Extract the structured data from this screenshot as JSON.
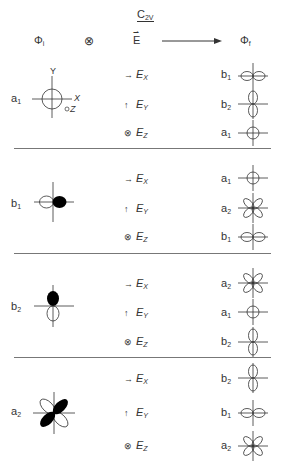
{
  "header": {
    "group": "C",
    "group_sub": "2V",
    "initial_state": "Φ",
    "initial_sub": "i",
    "product_symbol": "⊗",
    "field": "E",
    "final_state": "Φ",
    "final_sub": "f"
  },
  "axis_labels": {
    "x": "X",
    "y": "Y",
    "z": "Z"
  },
  "blocks": [
    {
      "initial": {
        "label": "a",
        "sub": "1",
        "orbital": "s-circle"
      },
      "rows": [
        {
          "field_icon": "→",
          "field": "E",
          "field_sub": "X",
          "final_label": "b",
          "final_sub": "1",
          "final_orbital": "px"
        },
        {
          "field_icon": "↑",
          "field": "E",
          "field_sub": "Y",
          "final_label": "b",
          "final_sub": "2",
          "final_orbital": "py"
        },
        {
          "field_icon": "⊗",
          "field": "E",
          "field_sub": "Z",
          "final_label": "a",
          "final_sub": "1",
          "final_orbital": "s"
        }
      ]
    },
    {
      "initial": {
        "label": "b",
        "sub": "1",
        "orbital": "px-shaded"
      },
      "rows": [
        {
          "field_icon": "→",
          "field": "E",
          "field_sub": "X",
          "final_label": "a",
          "final_sub": "1",
          "final_orbital": "s"
        },
        {
          "field_icon": "↑",
          "field": "E",
          "field_sub": "Y",
          "final_label": "a",
          "final_sub": "2",
          "final_orbital": "dxy"
        },
        {
          "field_icon": "⊗",
          "field": "E",
          "field_sub": "Z",
          "final_label": "b",
          "final_sub": "1",
          "final_orbital": "px"
        }
      ]
    },
    {
      "initial": {
        "label": "b",
        "sub": "2",
        "orbital": "py-shaded"
      },
      "rows": [
        {
          "field_icon": "→",
          "field": "E",
          "field_sub": "X",
          "final_label": "a",
          "final_sub": "2",
          "final_orbital": "dxy"
        },
        {
          "field_icon": "↑",
          "field": "E",
          "field_sub": "Y",
          "final_label": "a",
          "final_sub": "1",
          "final_orbital": "s"
        },
        {
          "field_icon": "⊗",
          "field": "E",
          "field_sub": "Z",
          "final_label": "b",
          "final_sub": "2",
          "final_orbital": "py"
        }
      ]
    },
    {
      "initial": {
        "label": "a",
        "sub": "2",
        "orbital": "dxy-shaded"
      },
      "rows": [
        {
          "field_icon": "→",
          "field": "E",
          "field_sub": "X",
          "final_label": "b",
          "final_sub": "2",
          "final_orbital": "py"
        },
        {
          "field_icon": "↑",
          "field": "E",
          "field_sub": "Y",
          "final_label": "b",
          "final_sub": "1",
          "final_orbital": "px"
        },
        {
          "field_icon": "⊗",
          "field": "E",
          "field_sub": "Z",
          "final_label": "a",
          "final_sub": "2",
          "final_orbital": "dxy"
        }
      ]
    }
  ],
  "colors": {
    "line": "#333333",
    "divider": "#777777",
    "fill": "#000000"
  }
}
